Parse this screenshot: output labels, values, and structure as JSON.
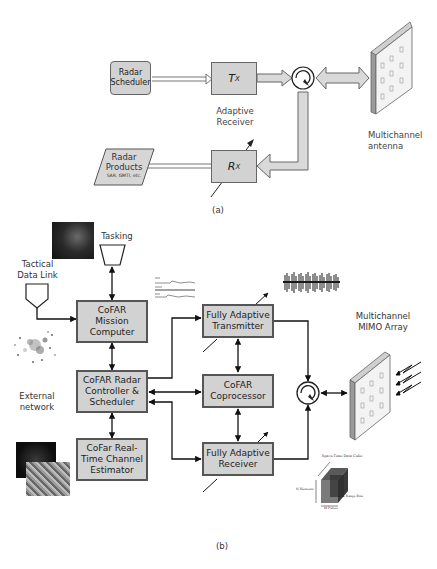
{
  "diagram_a": {
    "caption": "(a)",
    "radar_scheduler": "Radar\nScheduler",
    "tx": "T",
    "tx_sub": "X",
    "rx": "R",
    "rx_sub": "X",
    "adaptive_receiver": "Adaptive\nReceiver",
    "radar_products_title": "Radar\nProducts",
    "radar_products_sub": "SAR, GMTI, etc.",
    "multichannel_antenna": "Multichannel\nantenna"
  },
  "diagram_b": {
    "caption": "(b)",
    "tasking": "Tasking",
    "tactical_data_link": "Tactical\nData Link",
    "external_network": "External\nnetwork",
    "mission_computer": "CoFAR\nMission\nComputer",
    "radar_controller": "CoFAR Radar\nController &\nScheduler",
    "channel_estimator": "CoFar Real-\nTime Channel\nEstimator",
    "fully_adaptive_transmitter": "Fully Adaptive\nTransmitter",
    "coprocessor": "CoFAR\nCoprocessor",
    "fully_adaptive_receiver": "Fully Adaptive\nReceiver",
    "mimo_array": "Multichannel\nMIMO Array",
    "data_cube": {
      "title": "Space-Time Data Cube",
      "axis_elements": "N Elements",
      "axis_pulses": "M Pulses",
      "axis_range_bins": "L Range Bins",
      "axis_range_bins_top": "L Range Bins"
    }
  },
  "colors": {
    "box_fill": "#d2d2d2",
    "box_border": "#555555",
    "arrow_fill": "#d9d9d9",
    "line": "#222222"
  }
}
